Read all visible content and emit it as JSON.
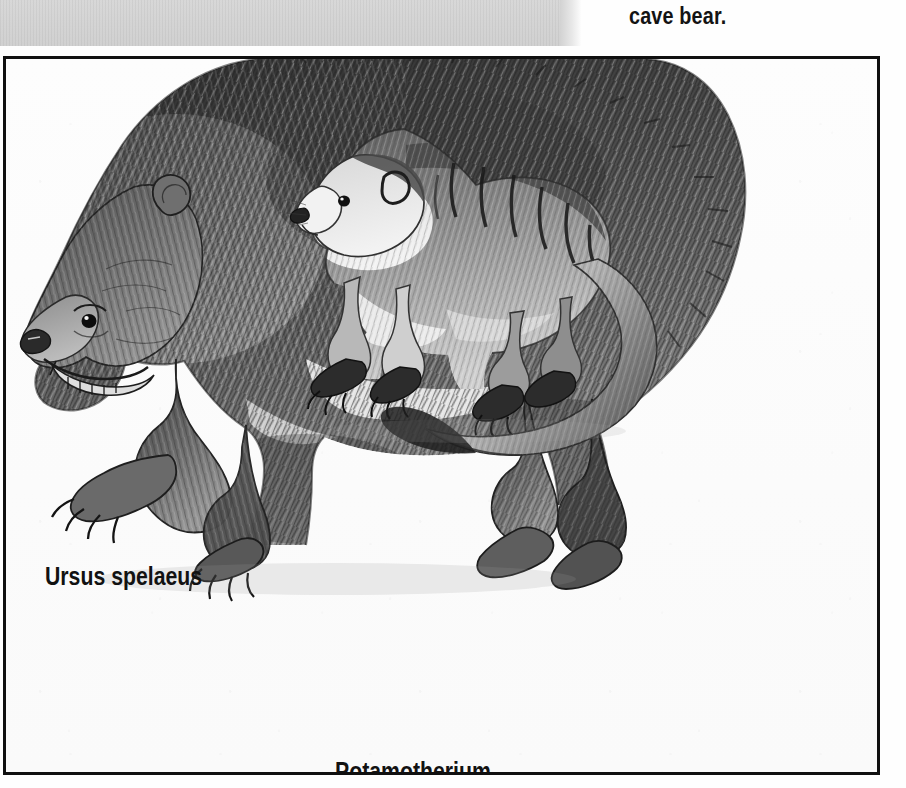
{
  "page": {
    "background_color": "#fefefe",
    "gutter_band_color": "#d2d2d2",
    "frame_border_color": "#101010",
    "ink_color": "#121212"
  },
  "caption": {
    "text": "cave bear."
  },
  "figure": {
    "medium": "black-and-white pencil / scraperboard illustration",
    "frame": {
      "border_width_px": 3
    },
    "specimens": [
      {
        "label": "Ursus spelaeus",
        "common_name": "cave bear",
        "description": "Large shaggy bear standing in profile facing left, long claws, open mouth showing teeth",
        "relative_size": "large"
      },
      {
        "label": "Potamotherium",
        "description": "Small otter-like mustelid carnivore facing left with pale face, dark banded back and long curving tail",
        "relative_size": "small"
      }
    ]
  },
  "labels": {
    "bear": "Ursus spelaeus",
    "otter": "Potamotherium"
  }
}
